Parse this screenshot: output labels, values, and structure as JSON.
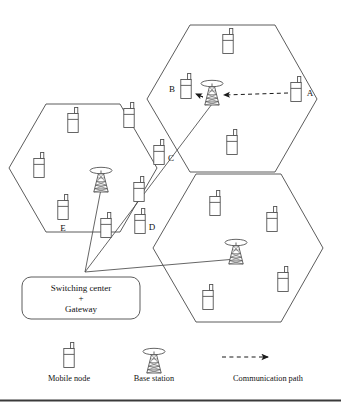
{
  "diagram": {
    "stroke_color": "#4a4a4a",
    "ink_color": "#111111",
    "background": "#ffffff",
    "cells": [
      {
        "id": "cell-left",
        "name": "left-hexagon",
        "cx": 83,
        "cy": 168,
        "r": 74
      },
      {
        "id": "cell-top-right",
        "name": "top-right-hexagon",
        "cx": 232,
        "cy": 99,
        "r": 85
      },
      {
        "id": "cell-bottom-right",
        "name": "bottom-right-hexagon",
        "cx": 238,
        "cy": 248,
        "r": 85
      }
    ],
    "base_stations": [
      {
        "id": "bs-left",
        "label": "",
        "x": 101,
        "y": 183
      },
      {
        "id": "bs-top-right",
        "label": "",
        "x": 212,
        "y": 96
      },
      {
        "id": "bs-bottom-right",
        "label": "",
        "x": 236,
        "y": 255
      }
    ],
    "mobile_nodes": [
      {
        "id": "mn-1",
        "label": "",
        "x": 228,
        "y": 44
      },
      {
        "id": "mn-2",
        "label": "B",
        "x": 186,
        "y": 89,
        "label_side": "left"
      },
      {
        "id": "mn-3",
        "label": "A",
        "x": 296,
        "y": 92,
        "label_side": "right"
      },
      {
        "id": "mn-4",
        "label": "",
        "x": 232,
        "y": 145
      },
      {
        "id": "mn-5",
        "label": "",
        "x": 73,
        "y": 123
      },
      {
        "id": "mn-6",
        "label": "",
        "x": 129,
        "y": 118
      },
      {
        "id": "mn-7",
        "label": "",
        "x": 39,
        "y": 168
      },
      {
        "id": "mn-8",
        "label": "C",
        "x": 159,
        "y": 155,
        "label_side": "right"
      },
      {
        "id": "mn-9",
        "label": "E",
        "x": 63,
        "y": 210,
        "label_side": "below"
      },
      {
        "id": "mn-10",
        "label": "",
        "x": 106,
        "y": 228
      },
      {
        "id": "mn-11",
        "label": "",
        "x": 139,
        "y": 192
      },
      {
        "id": "mn-12",
        "label": "D",
        "x": 140,
        "y": 224,
        "label_side": "right"
      },
      {
        "id": "mn-13",
        "label": "",
        "x": 215,
        "y": 206
      },
      {
        "id": "mn-14",
        "label": "",
        "x": 272,
        "y": 222
      },
      {
        "id": "mn-15",
        "label": "",
        "x": 283,
        "y": 282
      },
      {
        "id": "mn-16",
        "label": "",
        "x": 208,
        "y": 300
      }
    ],
    "switching_center": {
      "lines": [
        "Switching center",
        "+",
        "Gateway"
      ],
      "x": 22,
      "y": 277,
      "w": 118,
      "h": 42,
      "hub_x": 85,
      "hub_y": 272
    },
    "backhaul_links": [
      {
        "from": "hub",
        "to": "bs-left"
      },
      {
        "from": "hub",
        "to": "bs-top-right"
      },
      {
        "from": "hub",
        "to": "bs-bottom-right"
      }
    ],
    "comm_paths": [
      {
        "id": "path-a-to-bs",
        "from": "A",
        "to": "base-station",
        "style": "dashed-arrow"
      },
      {
        "id": "path-bs-to-b",
        "from": "base-station",
        "to": "B",
        "style": "dashed-arrow"
      }
    ]
  },
  "legend": {
    "items": [
      {
        "id": "legend-mobile-node",
        "icon": "mobile-node-icon",
        "label": "Mobile node"
      },
      {
        "id": "legend-base-station",
        "icon": "base-station-icon",
        "label": "Base station"
      },
      {
        "id": "legend-communication-path",
        "icon": "dashed-arrow-icon",
        "label": "Communication path"
      }
    ]
  }
}
